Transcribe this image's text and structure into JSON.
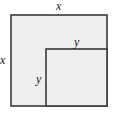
{
  "diagram": {
    "outer_square": {
      "label_top": "x",
      "label_left": "x",
      "fill": "#efefef",
      "stroke": "#3a3a3a"
    },
    "inner_square": {
      "label_top": "y",
      "label_left": "y",
      "fill": "#efefef",
      "stroke": "#3a3a3a"
    }
  }
}
